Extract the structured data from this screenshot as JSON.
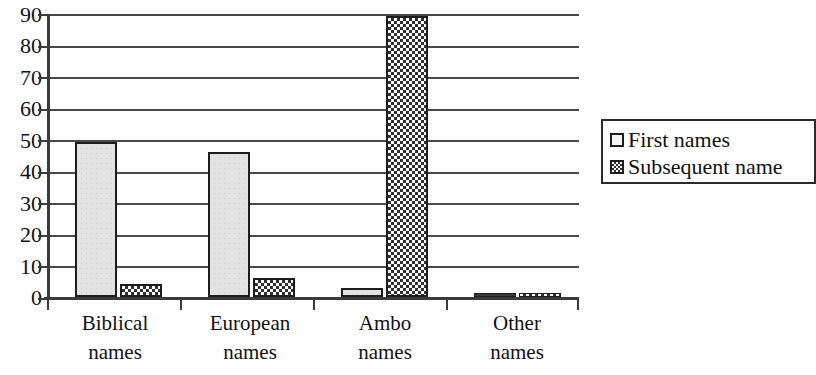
{
  "chart_data": {
    "type": "bar",
    "title": "",
    "xlabel": "",
    "ylabel": "",
    "ylim": [
      0,
      90
    ],
    "ytick_step": 10,
    "grid": true,
    "legend_position": "right",
    "categories": [
      "Biblical names",
      "European names",
      "Ambo names",
      "Other names"
    ],
    "category_lines": [
      {
        "line1": "Biblical",
        "line2": "names"
      },
      {
        "line1": "European",
        "line2": "names"
      },
      {
        "line1": "Ambo",
        "line2": "names"
      },
      {
        "line1": "Other",
        "line2": "names"
      }
    ],
    "yticks": [
      "90",
      "80",
      "70",
      "60",
      "50",
      "40",
      "30",
      "20",
      "10",
      "0"
    ],
    "ytick_values": [
      90,
      80,
      70,
      60,
      50,
      40,
      30,
      20,
      10,
      0
    ],
    "series": [
      {
        "name": "First names",
        "values": [
          49,
          46,
          3,
          1
        ],
        "pattern": "light-speckled"
      },
      {
        "name": "Subsequent name",
        "values": [
          4,
          6,
          89,
          1
        ],
        "pattern": "checkerboard"
      }
    ]
  },
  "legend": {
    "entries": [
      {
        "label": "First names",
        "swatch": "light-square-icon"
      },
      {
        "label": "Subsequent name",
        "swatch": "checkered-square-icon"
      }
    ]
  },
  "colors": {
    "axis": "#3b3b3b",
    "grid": "#4a4a4a",
    "bar_border": "#1d1d1d",
    "series_first_fill": "#e3e3e3",
    "series_subsequent_fill": "#2f2f2f",
    "background": "#ffffff",
    "text": "#111111"
  }
}
